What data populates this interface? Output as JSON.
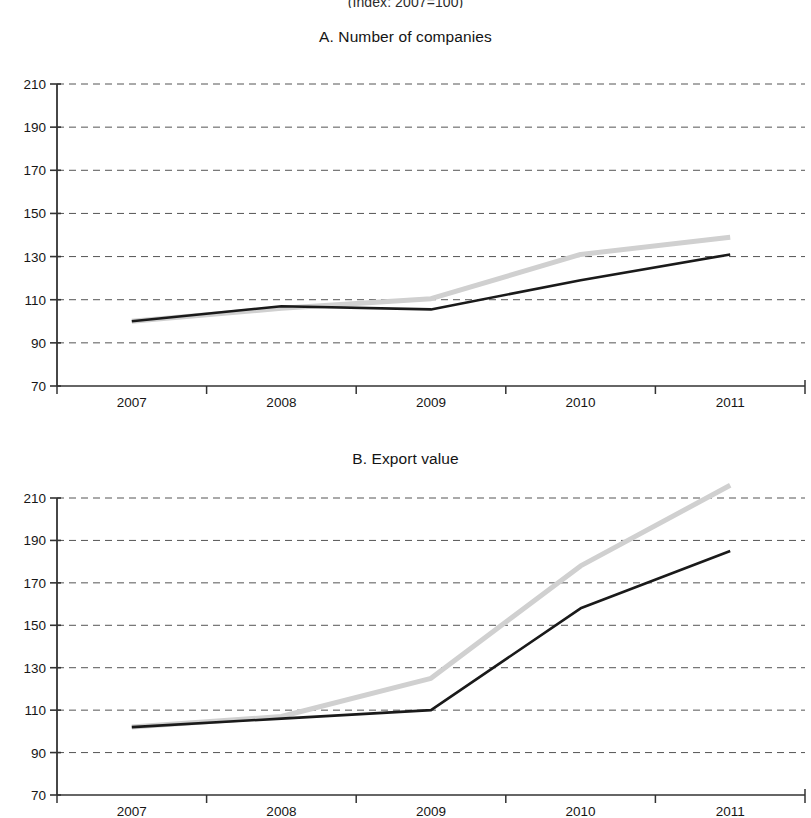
{
  "figure": {
    "suptitle": "(Index: 2007=100)"
  },
  "panels": [
    {
      "key": "A",
      "title": "A. Number of companies",
      "yticks": [
        "210",
        "190",
        "170",
        "150",
        "130",
        "110",
        "90",
        "70"
      ],
      "xticks": [
        "2007",
        "2008",
        "2009",
        "2010",
        "2011"
      ]
    },
    {
      "key": "B",
      "title": "B. Export value",
      "yticks": [
        "210",
        "190",
        "170",
        "150",
        "130",
        "110",
        "90",
        "70"
      ],
      "xticks": [
        "2007",
        "2008",
        "2009",
        "2010",
        "2011"
      ]
    }
  ],
  "colors": {
    "series_dark": "#1a1a1a",
    "series_light": "#d0d0d0",
    "gridline": "#555555",
    "axis": "#333333",
    "background": "#ffffff"
  },
  "chart_data": [
    {
      "type": "line",
      "title": "A. Number of companies",
      "subtitle": "(Index: 2007=100)",
      "xlabel": "",
      "ylabel": "",
      "categories": [
        "2007",
        "2008",
        "2009",
        "2010",
        "2011"
      ],
      "x": [
        2007,
        2008,
        2009,
        2010,
        2011
      ],
      "ylim": [
        70,
        210
      ],
      "yticks": [
        70,
        90,
        110,
        130,
        150,
        170,
        190,
        210
      ],
      "grid": true,
      "legend": "none",
      "series": [
        {
          "name": "series-dark",
          "color": "#1a1a1a",
          "values": [
            100,
            107,
            105.5,
            119,
            131
          ]
        },
        {
          "name": "series-light",
          "color": "#d0d0d0",
          "values": [
            100,
            106,
            110.5,
            131,
            139
          ]
        }
      ]
    },
    {
      "type": "line",
      "title": "B. Export value",
      "subtitle": "(Index: 2007=100)",
      "xlabel": "",
      "ylabel": "",
      "categories": [
        "2007",
        "2008",
        "2009",
        "2010",
        "2011"
      ],
      "x": [
        2007,
        2008,
        2009,
        2010,
        2011
      ],
      "ylim": [
        70,
        210
      ],
      "yticks": [
        70,
        90,
        110,
        130,
        150,
        170,
        190,
        210
      ],
      "grid": true,
      "legend": "none",
      "series": [
        {
          "name": "series-dark",
          "color": "#1a1a1a",
          "values": [
            102,
            106,
            110,
            158,
            185
          ]
        },
        {
          "name": "series-light",
          "color": "#d0d0d0",
          "values": [
            102,
            107,
            125,
            178,
            216
          ]
        }
      ]
    }
  ]
}
